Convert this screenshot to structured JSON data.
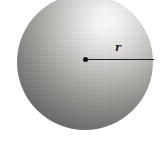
{
  "figure": {
    "type": "sphere-radius-diagram",
    "radius_label": "r",
    "colors": {
      "background": "#ffffff",
      "sphere_highlight": "#fefefe",
      "sphere_dark": "#504f4d",
      "line": "#1a1a1a",
      "dot": "#111111"
    }
  }
}
